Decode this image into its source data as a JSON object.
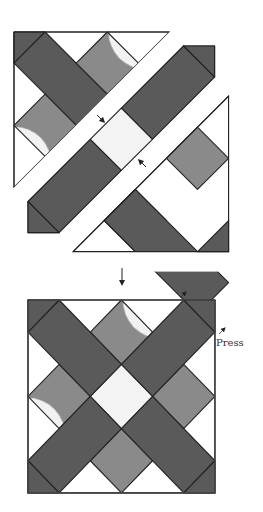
{
  "diagram": {
    "type": "quilt-block-assembly",
    "colors": {
      "dark_fabric": "#5a5a5a",
      "dotted_fabric": "#8a8a8a",
      "dot_color": "#f2f2f2",
      "light_center": "#f0f0f0",
      "background_fabric": "#ffffff",
      "outline": "#222222"
    },
    "step_arrow": "down-arrow",
    "labels": {
      "press": "Press"
    },
    "sections": [
      {
        "name": "top-left-triangle-section",
        "pieces": [
          "dark-corner",
          "dark-bar",
          "dotted-square",
          "dotted-square",
          "white-triangles"
        ]
      },
      {
        "name": "center-diagonal-strip",
        "pieces": [
          "dark-corner",
          "dark-bar",
          "light-center-square",
          "dark-bar",
          "dark-corner"
        ]
      },
      {
        "name": "bottom-right-triangle-section",
        "pieces": [
          "dotted-square",
          "dotted-square",
          "dark-bar",
          "dark-corner",
          "white-triangles"
        ]
      }
    ],
    "finished_block": {
      "name": "x-block",
      "pieces": [
        "4 dark corners",
        "4 dark bars",
        "4 dotted squares",
        "light center square",
        "white setting triangles"
      ]
    }
  }
}
